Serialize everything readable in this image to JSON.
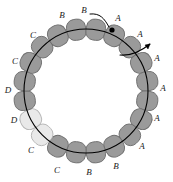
{
  "figure": {
    "background_color": "#ffffff",
    "ring": {
      "center_x": 86,
      "center_y": 91,
      "radius": 62,
      "stroke_color": "#000000",
      "stroke_width": 1.1
    },
    "bead_colors": {
      "dark_fill": "#9a9a9a",
      "dark_stroke": "#6f6f6f",
      "light_fill": "#e9e9e9",
      "light_stroke": "#b5b5b5"
    },
    "marker": {
      "name": "black-dot-marker",
      "x": 112,
      "y": 30,
      "radius": 2.6,
      "color": "#000000"
    },
    "beads": [
      {
        "index": 0,
        "angle_deg": -99,
        "shade": "dark",
        "label": "B"
      },
      {
        "index": 1,
        "angle_deg": -81,
        "shade": "dark",
        "label": "B"
      },
      {
        "index": 2,
        "angle_deg": -63,
        "shade": "dark",
        "label": "A"
      },
      {
        "index": 3,
        "angle_deg": -45,
        "shade": "dark",
        "label": "A"
      },
      {
        "index": 4,
        "angle_deg": -27,
        "shade": "dark",
        "label": "A"
      },
      {
        "index": 5,
        "angle_deg": -9,
        "shade": "dark",
        "label": "A"
      },
      {
        "index": 6,
        "angle_deg": 9,
        "shade": "dark",
        "label": "A"
      },
      {
        "index": 7,
        "angle_deg": 27,
        "shade": "dark",
        "label": "A"
      },
      {
        "index": 8,
        "angle_deg": 45,
        "shade": "dark",
        "label": "B"
      },
      {
        "index": 9,
        "angle_deg": 63,
        "shade": "dark",
        "label": "B"
      },
      {
        "index": 10,
        "angle_deg": 81,
        "shade": "dark",
        "label": "C"
      },
      {
        "index": 11,
        "angle_deg": 99,
        "shade": "dark",
        "label": "C"
      },
      {
        "index": 12,
        "angle_deg": 117,
        "shade": "dark",
        "label": "C"
      },
      {
        "index": 13,
        "angle_deg": 135,
        "shade": "light",
        "label": "D"
      },
      {
        "index": 14,
        "angle_deg": 153,
        "shade": "light",
        "label": "D"
      },
      {
        "index": 15,
        "angle_deg": 171,
        "shade": "dark",
        "label": "C"
      },
      {
        "index": 16,
        "angle_deg": -171,
        "shade": "dark",
        "label": "C"
      },
      {
        "index": 17,
        "angle_deg": -153,
        "shade": "dark",
        "label": "C"
      },
      {
        "index": 18,
        "angle_deg": -135,
        "shade": "dark",
        "label": "B"
      },
      {
        "index": 19,
        "angle_deg": -117,
        "shade": "dark",
        "label": "B"
      }
    ],
    "labels": [
      {
        "name": "label-B-top-left",
        "text": "B",
        "x": 62,
        "y": 15
      },
      {
        "name": "label-B-callout",
        "text": "B",
        "x": 84,
        "y": 10
      },
      {
        "name": "label-A-top-right",
        "text": "A",
        "x": 118,
        "y": 18
      },
      {
        "name": "label-A-upper-right",
        "text": "A",
        "x": 140,
        "y": 34
      },
      {
        "name": "label-A-right-1",
        "text": "A",
        "x": 157,
        "y": 58
      },
      {
        "name": "label-A-right-2",
        "text": "A",
        "x": 163,
        "y": 88
      },
      {
        "name": "label-A-right-3",
        "text": "A",
        "x": 157,
        "y": 118
      },
      {
        "name": "label-A-lower-right",
        "text": "A",
        "x": 142,
        "y": 146
      },
      {
        "name": "label-B-bottom-right",
        "text": "B",
        "x": 116,
        "y": 166
      },
      {
        "name": "label-B-bottom",
        "text": "B",
        "x": 89,
        "y": 172
      },
      {
        "name": "label-C-bottom",
        "text": "C",
        "x": 57,
        "y": 170
      },
      {
        "name": "label-C-bottom-left",
        "text": "C",
        "x": 31,
        "y": 150
      },
      {
        "name": "label-D-lower-left",
        "text": "D",
        "x": 14,
        "y": 120
      },
      {
        "name": "label-D-left",
        "text": "D",
        "x": 8,
        "y": 90
      },
      {
        "name": "label-C-left",
        "text": "C",
        "x": 15,
        "y": 61
      },
      {
        "name": "label-C-upper-left",
        "text": "C",
        "x": 33,
        "y": 35
      }
    ],
    "callout_leader": {
      "name": "callout-leader-line",
      "path": "M 90 14 C 100 13, 104 18, 109 27",
      "color": "#000000",
      "width": 1
    },
    "direction_arrow": {
      "name": "direction-arrow",
      "path": "M 120 55 C 130 56, 140 52, 150 44",
      "arrow_tip": "M 150 44 L 145 45 L 148 49 Z",
      "color": "#000000",
      "width": 1.1
    }
  }
}
